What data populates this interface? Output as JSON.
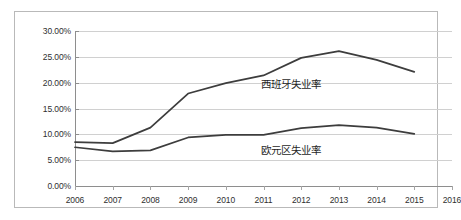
{
  "chart_data": {
    "type": "line",
    "title": "",
    "xlabel": "",
    "ylabel": "",
    "grid": true,
    "legend_position": "inline-right",
    "x": [
      2006,
      2007,
      2008,
      2009,
      2010,
      2011,
      2012,
      2013,
      2014,
      2015,
      2016
    ],
    "xtick_labels": [
      "2006",
      "2007",
      "2008",
      "2009",
      "2010",
      "2011",
      "2012",
      "2013",
      "2014",
      "2015",
      "2016"
    ],
    "ylim": [
      0,
      30
    ],
    "ytick_values": [
      0,
      5,
      10,
      15,
      20,
      25,
      30
    ],
    "ytick_labels": [
      "0.00%",
      "5.00%",
      "10.00%",
      "15.00%",
      "20.00%",
      "25.00%",
      "30.00%"
    ],
    "series": [
      {
        "name": "西班牙失业率",
        "color": "#3d3d3d",
        "x": [
          2006,
          2007,
          2008,
          2009,
          2010,
          2011,
          2012,
          2013,
          2014,
          2015
        ],
        "values": [
          8.5,
          8.3,
          11.3,
          17.9,
          19.9,
          21.4,
          24.8,
          26.1,
          24.4,
          22.1
        ]
      },
      {
        "name": "欧元区失业率",
        "color": "#3d3d3d",
        "x": [
          2006,
          2007,
          2008,
          2009,
          2010,
          2011,
          2012,
          2013,
          2014,
          2015
        ],
        "values": [
          7.5,
          6.7,
          6.9,
          9.4,
          9.9,
          9.9,
          11.2,
          11.8,
          11.3,
          10.1
        ]
      }
    ],
    "annotations": [
      {
        "text": "西班牙失业率",
        "series": "西班牙失业率"
      },
      {
        "text": "欧元区失业率",
        "series": "欧元区失业率"
      }
    ]
  }
}
